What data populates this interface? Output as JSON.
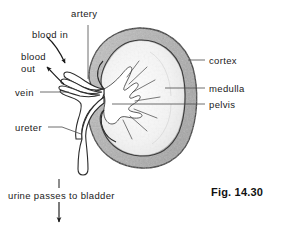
{
  "figure": {
    "caption": "Fig. 14.30"
  },
  "labels": {
    "artery": "artery",
    "blood_in": "blood in",
    "blood_out_line1": "blood",
    "blood_out_line2": "out",
    "vein": "vein",
    "ureter": "ureter",
    "cortex": "cortex",
    "medulla": "medulla",
    "pelvis": "pelvis",
    "urine_flow": "urine passes to bladder"
  },
  "colors": {
    "outline": "#2b2b2b",
    "cortex_fill": "#b9b9b9",
    "cortex_fill_dark": "#a8a8a8",
    "medulla_fill": "#f2f2f2",
    "pelvis_fill": "#ffffff",
    "text": "#1a1a1a",
    "leader": "#4a4a4a",
    "background": "#ffffff"
  }
}
